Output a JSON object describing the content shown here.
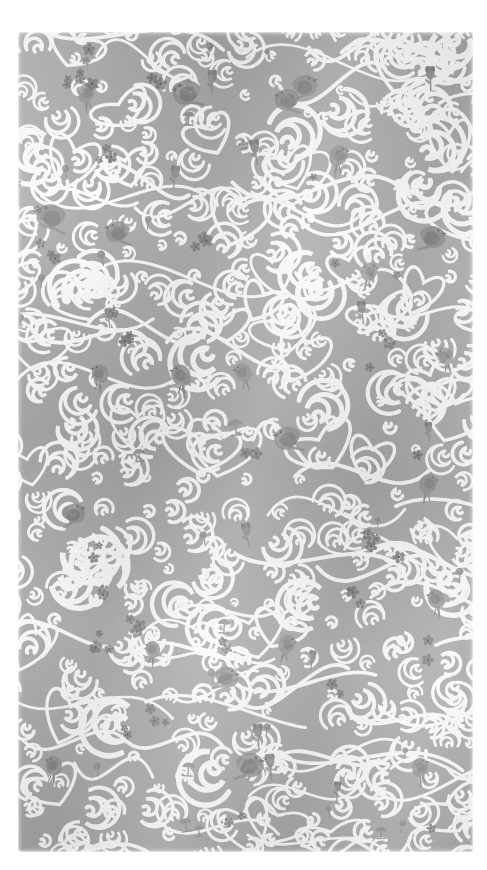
{
  "page": {
    "background_color": "#ffffff",
    "width": 487,
    "height": 870
  },
  "swatch": {
    "name": "Klimt Tree of Life swirl pattern swatch",
    "description": "Art Nouveau scrolling spiral vine pattern with perched birds, small blossoms and tulips",
    "base_color": "#a8a8a8",
    "swirl_color": "#ffffff",
    "motif_color": "#8a8a8a",
    "motif_dark_color": "#6e6e6e",
    "blossom_color": "#7a7a7a",
    "left": 18,
    "top": 32,
    "width": 455,
    "height": 820
  },
  "margin_notes": {
    "note_top": "··\n·",
    "note_bottom": "·"
  },
  "icons": {
    "bird": "bird-motif",
    "blossom": "blossom-motif",
    "tulip": "tulip-motif",
    "spiral": "spiral-scroll-motif"
  }
}
